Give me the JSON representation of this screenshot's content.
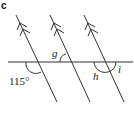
{
  "part_label": "c",
  "diagram": {
    "labels": {
      "given_angle": "115°",
      "angle_g": "g",
      "angle_h": "h",
      "angle_i": "i"
    },
    "colors": {
      "line": "#333333",
      "background": "#ffffff"
    }
  }
}
